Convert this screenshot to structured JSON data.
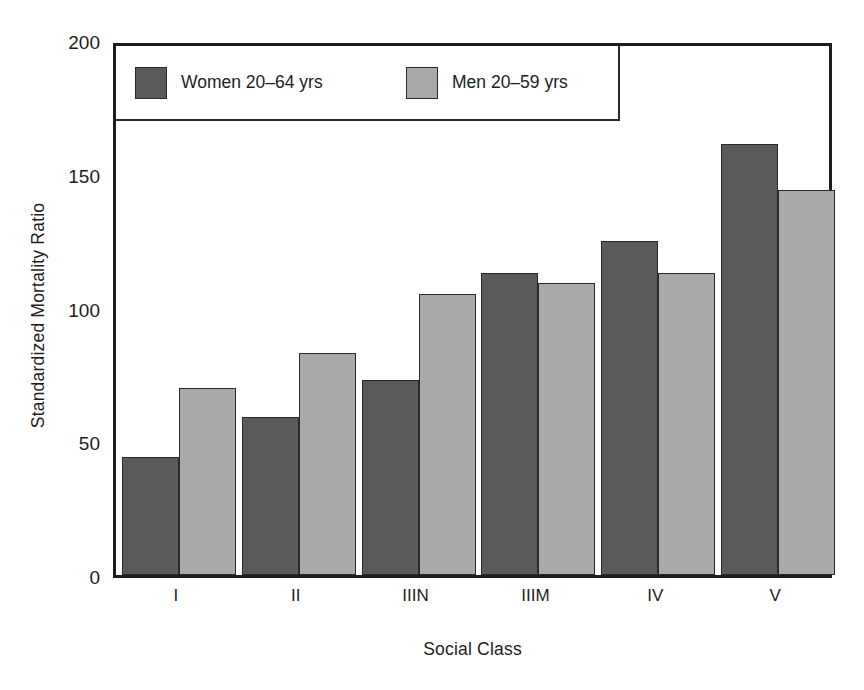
{
  "chart_data": {
    "type": "bar",
    "title": "",
    "xlabel": "Social Class",
    "ylabel": "Standardized Mortality Ratio",
    "categories": [
      "I",
      "II",
      "IIIN",
      "IIIM",
      "IV",
      "V"
    ],
    "series": [
      {
        "name": "Women 20–64 yrs",
        "color": "#5a5a5c",
        "values": [
          44,
          59,
          73,
          113,
          125,
          161
        ]
      },
      {
        "name": "Men 20–59 yrs",
        "color": "#a9a9ab",
        "values": [
          70,
          83,
          105,
          109,
          113,
          144
        ]
      }
    ],
    "ylim": [
      0,
      200
    ],
    "yticks": [
      0,
      50,
      100,
      150,
      200
    ],
    "ytick_labels": [
      "0",
      "50",
      "100",
      "150",
      "200"
    ],
    "grid": false,
    "legend_position": "top-left",
    "frame": true
  },
  "legend": {
    "entries": [
      {
        "label": "Women 20–64 yrs",
        "swatch": "women"
      },
      {
        "label": "Men 20–59 yrs",
        "swatch": "men"
      }
    ]
  },
  "colors": {
    "women": "#5a5a5c",
    "men": "#a9a9ab",
    "frame": "#1c1c1c",
    "text": "#1d1d1d",
    "background": "#ffffff"
  }
}
